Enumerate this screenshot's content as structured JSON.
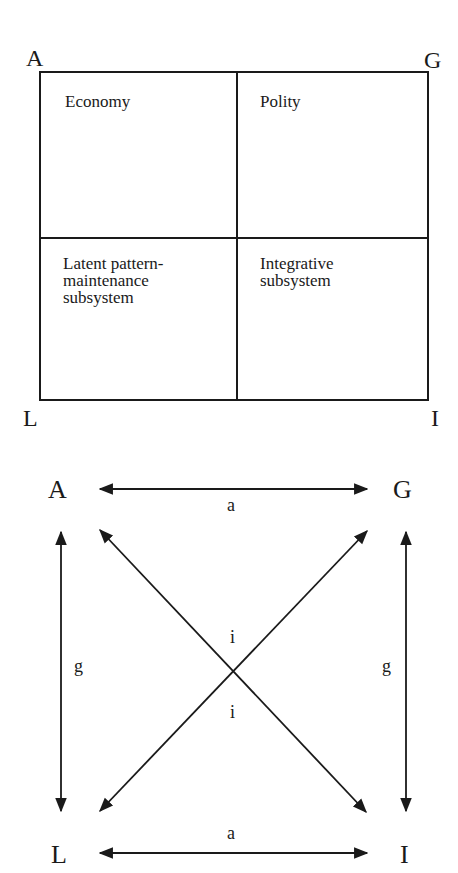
{
  "matrix": {
    "corners": {
      "top_left": "A",
      "top_right": "G",
      "bottom_left": "L",
      "bottom_right": "I"
    },
    "cells": {
      "top_left": "Economy",
      "top_right": "Polity",
      "bottom_left_lines": [
        "Latent pattern-",
        "maintenance",
        "subsystem"
      ],
      "bottom_right_lines": [
        "Integrative",
        "subsystem"
      ]
    }
  },
  "network": {
    "nodes": {
      "top_left": "A",
      "top_right": "G",
      "bottom_left": "L",
      "bottom_right": "I"
    },
    "edge_labels": {
      "top": "a",
      "bottom": "a",
      "left": "g",
      "right": "g",
      "center_upper": "i",
      "center_lower": "i"
    }
  }
}
